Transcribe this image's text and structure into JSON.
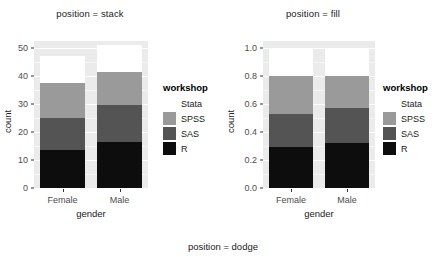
{
  "caption": "position = dodge",
  "legend": {
    "title": "workshop",
    "entries": [
      {
        "label": "Stata",
        "color": "#ffffff"
      },
      {
        "label": "SPSS",
        "color": "#9a9a9a"
      },
      {
        "label": "SAS",
        "color": "#545454"
      },
      {
        "label": "R",
        "color": "#0d0d0d"
      }
    ]
  },
  "colors": {
    "panel_background": "#ebebeb",
    "grid": "#ffffff",
    "tick_text": "#4d4d4d",
    "title_text": "#1a1a1a",
    "Stata": "#ffffff",
    "SPSS": "#9a9a9a",
    "SAS": "#545454",
    "R": "#0d0d0d"
  },
  "chart_data": [
    {
      "type": "bar",
      "title": "position = stack",
      "stacking": "stack",
      "xlabel": "gender",
      "ylabel": "count",
      "categories": [
        "Female",
        "Male"
      ],
      "ylim": [
        0,
        52.5
      ],
      "yticks": [
        0,
        10,
        20,
        30,
        40,
        50
      ],
      "ytick_labels": [
        "0",
        "10",
        "20",
        "30",
        "40",
        "50"
      ],
      "grid": true,
      "legend_position": "right",
      "series": [
        {
          "name": "R",
          "color": "#0d0d0d",
          "values": [
            13.5,
            16.5
          ]
        },
        {
          "name": "SAS",
          "color": "#545454",
          "values": [
            11.5,
            13.0
          ]
        },
        {
          "name": "SPSS",
          "color": "#9a9a9a",
          "values": [
            12.5,
            12.0
          ]
        },
        {
          "name": "Stata",
          "color": "#ffffff",
          "values": [
            9.5,
            9.5
          ]
        }
      ],
      "cumulative_tops": {
        "Female": {
          "R": 13.5,
          "SAS": 25.0,
          "SPSS": 37.5,
          "Stata": 47.0
        },
        "Male": {
          "R": 16.5,
          "SAS": 29.5,
          "SPSS": 41.5,
          "Stata": 51.0
        }
      }
    },
    {
      "type": "bar",
      "title": "position = fill",
      "stacking": "fill",
      "xlabel": "gender",
      "ylabel": "count",
      "categories": [
        "Female",
        "Male"
      ],
      "ylim": [
        0,
        1.05
      ],
      "yticks": [
        0.0,
        0.2,
        0.4,
        0.6,
        0.8,
        1.0
      ],
      "ytick_labels": [
        "0.0",
        "0.2",
        "0.4",
        "0.6",
        "0.8",
        "1.0"
      ],
      "grid": true,
      "legend_position": "right",
      "series": [
        {
          "name": "R",
          "color": "#0d0d0d",
          "values": [
            0.295,
            0.324
          ]
        },
        {
          "name": "SAS",
          "color": "#545454",
          "values": [
            0.235,
            0.245
          ]
        },
        {
          "name": "SPSS",
          "color": "#9a9a9a",
          "values": [
            0.27,
            0.231
          ]
        },
        {
          "name": "Stata",
          "color": "#ffffff",
          "values": [
            0.2,
            0.2
          ]
        }
      ],
      "cumulative_tops": {
        "Female": {
          "R": 0.295,
          "SAS": 0.53,
          "SPSS": 0.8,
          "Stata": 1.0
        },
        "Male": {
          "R": 0.324,
          "SAS": 0.569,
          "SPSS": 0.8,
          "Stata": 1.0
        }
      }
    }
  ]
}
